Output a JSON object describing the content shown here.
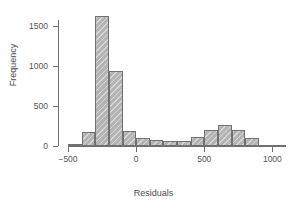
{
  "chart_data": {
    "type": "bar",
    "subtype": "histogram",
    "title": "",
    "xlabel": "Residuals",
    "ylabel": "Frequency",
    "xlim": [
      -500,
      1100
    ],
    "ylim": [
      0,
      1625
    ],
    "grid": false,
    "legend": null,
    "bin_width": 100,
    "xticks": [
      -500,
      0,
      500,
      1000
    ],
    "xtick_labels": [
      "−500",
      "0",
      "500",
      "1000"
    ],
    "yticks": [
      0,
      500,
      1000,
      1500
    ],
    "ytick_labels": [
      "0",
      "500",
      "1000",
      "1500"
    ],
    "bin_edges": [
      -500,
      -400,
      -300,
      -200,
      -100,
      0,
      100,
      200,
      300,
      400,
      500,
      600,
      700,
      800,
      900,
      1000,
      1100
    ],
    "categories": [
      "-500..-400",
      "-400..-300",
      "-300..-200",
      "-200..-100",
      "-100..0",
      "0..100",
      "100..200",
      "200..300",
      "300..400",
      "400..500",
      "500..600",
      "600..700",
      "700..800",
      "800..900",
      "900..1000",
      "1000..1100"
    ],
    "values": [
      25,
      170,
      1620,
      940,
      185,
      95,
      70,
      65,
      65,
      115,
      205,
      260,
      200,
      95,
      10,
      5
    ],
    "bar_fill": "#b4b4b4",
    "bar_edge": "#717171",
    "axis_color": "#6e6e6e"
  }
}
